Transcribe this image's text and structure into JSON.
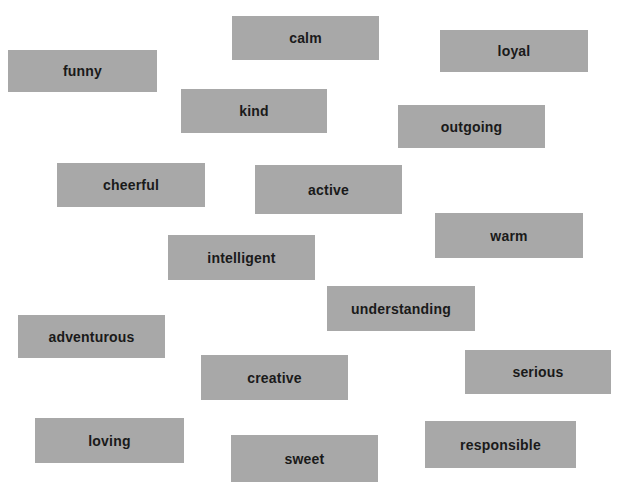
{
  "page": {
    "background_color": "#ffffff",
    "width": 622,
    "height": 493
  },
  "style": {
    "card_fill_color": "#a8a8a8",
    "card_text_color": "#1a1a1a"
  },
  "cards": [
    {
      "label": "calm",
      "x": 232,
      "y": 16,
      "w": 147,
      "h": 44
    },
    {
      "label": "loyal",
      "x": 440,
      "y": 30,
      "w": 148,
      "h": 42
    },
    {
      "label": "funny",
      "x": 8,
      "y": 50,
      "w": 149,
      "h": 42
    },
    {
      "label": "kind",
      "x": 181,
      "y": 89,
      "w": 146,
      "h": 44
    },
    {
      "label": "outgoing",
      "x": 398,
      "y": 105,
      "w": 147,
      "h": 43
    },
    {
      "label": "cheerful",
      "x": 57,
      "y": 163,
      "w": 148,
      "h": 44
    },
    {
      "label": "active",
      "x": 255,
      "y": 165,
      "w": 147,
      "h": 49
    },
    {
      "label": "warm",
      "x": 435,
      "y": 213,
      "w": 148,
      "h": 45
    },
    {
      "label": "intelligent",
      "x": 168,
      "y": 235,
      "w": 147,
      "h": 45
    },
    {
      "label": "understanding",
      "x": 327,
      "y": 286,
      "w": 148,
      "h": 45
    },
    {
      "label": "adventurous",
      "x": 18,
      "y": 315,
      "w": 147,
      "h": 43
    },
    {
      "label": "serious",
      "x": 465,
      "y": 350,
      "w": 146,
      "h": 44
    },
    {
      "label": "creative",
      "x": 201,
      "y": 355,
      "w": 147,
      "h": 45
    },
    {
      "label": "loving",
      "x": 35,
      "y": 418,
      "w": 149,
      "h": 45
    },
    {
      "label": "responsible",
      "x": 425,
      "y": 421,
      "w": 151,
      "h": 47
    },
    {
      "label": "sweet",
      "x": 231,
      "y": 435,
      "w": 147,
      "h": 47
    }
  ]
}
